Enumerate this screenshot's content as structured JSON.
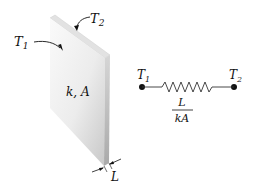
{
  "figure": {
    "slab": {
      "left_temp_label": "T",
      "left_temp_sub": "1",
      "right_temp_label": "T",
      "right_temp_sub": "2",
      "properties_label": "k, A",
      "thickness_label": "L"
    },
    "circuit": {
      "left_node_label": "T",
      "left_node_sub": "1",
      "right_node_label": "T",
      "right_node_sub": "2",
      "resistance_numerator": "L",
      "resistance_denominator": "kA"
    },
    "colors": {
      "slab_front_light": "#f4f4f4",
      "slab_front_dark": "#cfcfcf",
      "slab_side": "#bdbdbd",
      "slab_top": "#e6e6e6",
      "ink": "#111111"
    }
  }
}
